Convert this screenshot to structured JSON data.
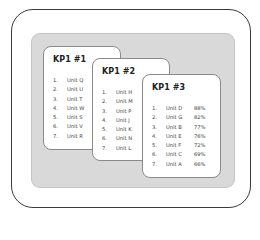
{
  "diagram": {
    "cards": [
      {
        "title": "KP1 #1",
        "items": [
          {
            "num": "1.",
            "unit": "Unit Q"
          },
          {
            "num": "2.",
            "unit": "Unit U"
          },
          {
            "num": "3.",
            "unit": "Unit T"
          },
          {
            "num": "4.",
            "unit": "Unit W"
          },
          {
            "num": "5.",
            "unit": "Unit S"
          },
          {
            "num": "6.",
            "unit": "Unit V"
          },
          {
            "num": "7.",
            "unit": "Unit R"
          }
        ]
      },
      {
        "title": "KP1 #2",
        "items": [
          {
            "num": "1.",
            "unit": "Unit H"
          },
          {
            "num": "2.",
            "unit": "Unit M"
          },
          {
            "num": "3.",
            "unit": "Unit P"
          },
          {
            "num": "4.",
            "unit": "Unit J"
          },
          {
            "num": "5.",
            "unit": "Unit K"
          },
          {
            "num": "6.",
            "unit": "Unit N"
          },
          {
            "num": "7.",
            "unit": "Unit L"
          }
        ]
      },
      {
        "title": "KP1 #3",
        "items": [
          {
            "num": "1.",
            "unit": "Unit D",
            "pct": "88%"
          },
          {
            "num": "2.",
            "unit": "Unit G",
            "pct": "82%"
          },
          {
            "num": "3.",
            "unit": "Unit B",
            "pct": "77%"
          },
          {
            "num": "4.",
            "unit": "Unit E",
            "pct": "76%"
          },
          {
            "num": "5.",
            "unit": "Unit F",
            "pct": "72%"
          },
          {
            "num": "6.",
            "unit": "Unit C",
            "pct": "69%"
          },
          {
            "num": "7.",
            "unit": "Unit A",
            "pct": "66%"
          }
        ]
      }
    ]
  },
  "colors": {
    "panel": "#d9d9d9",
    "frame_border": "#3a3a3a",
    "card_border": "#8a8a8a"
  }
}
